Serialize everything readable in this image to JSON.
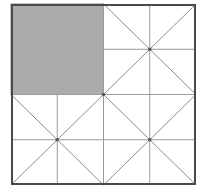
{
  "figure": {
    "type": "geometric-diagram",
    "canvas": {
      "width": 205,
      "height": 195
    },
    "colors": {
      "background": "#ffffff",
      "frame_stroke": "#4a4a4a",
      "grid_stroke": "#9a9a9a",
      "diagonal_stroke": "#8d8d8d",
      "shaded_fill": "#ababab",
      "shaded_stroke": "#8a8a8a"
    },
    "stroke_widths": {
      "frame": 2,
      "grid": 1,
      "diagonal": 1
    },
    "outer_square": {
      "label": "outer-square",
      "x": 11,
      "y": 4,
      "width": 185,
      "height": 181
    },
    "center_point": {
      "x": 103.5,
      "y": 94.5
    },
    "quadrants": [
      {
        "name": "top-left",
        "x": 11,
        "y": 4,
        "width": 92.5,
        "height": 90.5,
        "shaded": true,
        "subdivided": false,
        "diagonals": false,
        "fill": "#ababab"
      },
      {
        "name": "top-right",
        "x": 103.5,
        "y": 4,
        "width": 92.5,
        "height": 90.5,
        "shaded": false,
        "subdivided": true,
        "diagonals": true,
        "fill": "#ffffff"
      },
      {
        "name": "bottom-left",
        "x": 11,
        "y": 94.5,
        "width": 92.5,
        "height": 90.5,
        "shaded": false,
        "subdivided": true,
        "diagonals": true,
        "fill": "#ffffff"
      },
      {
        "name": "bottom-right",
        "x": 103.5,
        "y": 94.5,
        "width": 92.5,
        "height": 90.5,
        "shaded": false,
        "subdivided": true,
        "diagonals": true,
        "fill": "#ffffff"
      }
    ],
    "grid_lines": [
      {
        "name": "quadrant-divider-vertical",
        "x1": 103.5,
        "y1": 4,
        "x2": 103.5,
        "y2": 185
      },
      {
        "name": "quadrant-divider-horizontal",
        "x1": 11,
        "y1": 94.5,
        "x2": 196,
        "y2": 94.5
      },
      {
        "name": "top-right-vertical-midline",
        "x1": 149.75,
        "y1": 4,
        "x2": 149.75,
        "y2": 94.5
      },
      {
        "name": "top-right-horizontal-midline",
        "x1": 103.5,
        "y1": 49.25,
        "x2": 196,
        "y2": 49.25
      },
      {
        "name": "bottom-left-vertical-midline",
        "x1": 57.25,
        "y1": 94.5,
        "x2": 57.25,
        "y2": 185
      },
      {
        "name": "bottom-horizontal-midline",
        "x1": 11,
        "y1": 139.75,
        "x2": 196,
        "y2": 139.75
      },
      {
        "name": "bottom-right-vertical-midline",
        "x1": 149.75,
        "y1": 94.5,
        "x2": 149.75,
        "y2": 185
      }
    ],
    "diagonal_lines": [
      {
        "name": "top-right-diagonal-down",
        "x1": 103.5,
        "y1": 4,
        "x2": 196,
        "y2": 94.5
      },
      {
        "name": "top-right-diagonal-up",
        "x1": 103.5,
        "y1": 94.5,
        "x2": 196,
        "y2": 4
      },
      {
        "name": "bottom-left-diagonal-down",
        "x1": 11,
        "y1": 94.5,
        "x2": 103.5,
        "y2": 185
      },
      {
        "name": "bottom-left-diagonal-up",
        "x1": 11,
        "y1": 185,
        "x2": 103.5,
        "y2": 94.5
      },
      {
        "name": "bottom-right-diagonal-down",
        "x1": 103.5,
        "y1": 94.5,
        "x2": 196,
        "y2": 185
      },
      {
        "name": "bottom-right-diagonal-up",
        "x1": 103.5,
        "y1": 185,
        "x2": 196,
        "y2": 94.5
      }
    ],
    "x_centers": [
      {
        "name": "top-right-x-center",
        "cx": 149.75,
        "cy": 49.25
      },
      {
        "name": "bottom-left-x-center",
        "cx": 57.25,
        "cy": 139.75
      },
      {
        "name": "bottom-right-x-center",
        "cx": 149.75,
        "cy": 139.75
      }
    ]
  }
}
